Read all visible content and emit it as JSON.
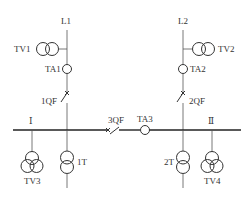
{
  "diagram": {
    "type": "single-line electrical wiring diagram",
    "colors": {
      "line": "#555555",
      "bus": "#222222",
      "text": "#333333",
      "background": "#ffffff"
    },
    "incoming_lines": [
      {
        "id": "L1",
        "label": "L1"
      },
      {
        "id": "L2",
        "label": "L2"
      }
    ],
    "voltage_transformers": [
      {
        "id": "TV1",
        "label": "TV1",
        "type": "two-winding"
      },
      {
        "id": "TV2",
        "label": "TV2",
        "type": "two-winding"
      },
      {
        "id": "TV3",
        "label": "TV3",
        "type": "three-winding"
      },
      {
        "id": "TV4",
        "label": "TV4",
        "type": "three-winding"
      }
    ],
    "current_transformers": [
      {
        "id": "TA1",
        "label": "TA1"
      },
      {
        "id": "TA2",
        "label": "TA2"
      },
      {
        "id": "TA3",
        "label": "TA3"
      }
    ],
    "circuit_breakers": [
      {
        "id": "1QF",
        "label": "1QF"
      },
      {
        "id": "2QF",
        "label": "2QF"
      },
      {
        "id": "3QF",
        "label": "3QF",
        "role": "bus coupler"
      }
    ],
    "bus_sections": [
      {
        "id": "I",
        "label": "Ⅰ"
      },
      {
        "id": "II",
        "label": "Ⅱ"
      }
    ],
    "power_transformers": [
      {
        "id": "1T",
        "label": "1T"
      },
      {
        "id": "2T",
        "label": "2T"
      }
    ]
  }
}
